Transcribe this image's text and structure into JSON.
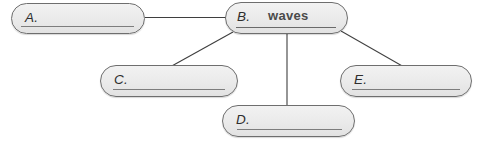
{
  "diagram": {
    "type": "concept-map",
    "title": "",
    "center_node_id": "B",
    "colors": {
      "node_fill": "#eaeaea",
      "node_border": "#6e6e6e",
      "connector": "#3f3f3f",
      "label_text": "#2e2e2e",
      "value_text": "#4a4a4a",
      "write_line": "#7d7d7d",
      "background": "#ffffff"
    },
    "nodes": [
      {
        "id": "A",
        "label": "A.",
        "value": "",
        "filled": false
      },
      {
        "id": "B",
        "label": "B.",
        "value": "waves",
        "filled": true
      },
      {
        "id": "C",
        "label": "C.",
        "value": "",
        "filled": false
      },
      {
        "id": "D",
        "label": "D.",
        "value": "",
        "filled": false
      },
      {
        "id": "E",
        "label": "E.",
        "value": "",
        "filled": false
      }
    ],
    "connectors": [
      {
        "from": "B",
        "to": "A",
        "orientation": "horizontal"
      },
      {
        "from": "B",
        "to": "C",
        "orientation": "diagonal-down-left"
      },
      {
        "from": "B",
        "to": "D",
        "orientation": "vertical"
      },
      {
        "from": "B",
        "to": "E",
        "orientation": "diagonal-down-right"
      }
    ]
  }
}
